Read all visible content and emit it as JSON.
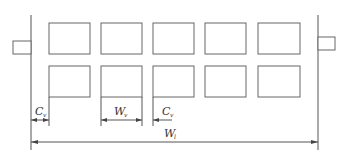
{
  "diagram": {
    "type": "layout-dimension-drawing",
    "rows": 2,
    "columns": 5,
    "labels": {
      "edge_clearance": {
        "main": "C",
        "sub": "v"
      },
      "cell_width": {
        "main": "W",
        "sub": "v"
      },
      "cell_gap": {
        "main": "C",
        "sub": "v"
      },
      "total_width": {
        "main": "W",
        "sub": "l"
      }
    },
    "colors": {
      "stroke": "#555555",
      "background": "#ffffff"
    }
  }
}
